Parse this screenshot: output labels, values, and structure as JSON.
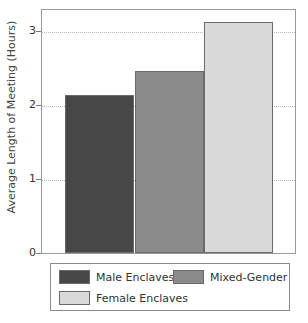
{
  "chart_data": {
    "type": "bar",
    "title": "",
    "xlabel": "",
    "ylabel": "Average Length of Meeting (Hours)",
    "categories": [
      "Male Enclaves",
      "Mixed-Gender",
      "Female Enclaves"
    ],
    "values": [
      2.13,
      2.46,
      3.12
    ],
    "colors": [
      "#474747",
      "#8b8b8b",
      "#dadada"
    ],
    "ylim": [
      0,
      3.3
    ],
    "yticks": [
      0,
      1,
      2,
      3
    ],
    "grid": true,
    "legend_position": "bottom"
  },
  "axis": {
    "ylabel": "Average Length of Meeting (Hours)",
    "ticks": [
      "0",
      "1",
      "2",
      "3"
    ]
  },
  "legend": {
    "items": [
      {
        "label": "Male Enclaves",
        "color": "#474747"
      },
      {
        "label": "Mixed-Gender",
        "color": "#8b8b8b"
      },
      {
        "label": "Female Enclaves",
        "color": "#dadada"
      }
    ]
  }
}
